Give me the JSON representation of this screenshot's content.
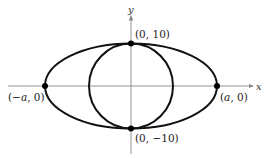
{
  "figure": {
    "axes": {
      "x_label": "x",
      "y_label": "y"
    },
    "points": [
      {
        "label": "(0, 10)"
      },
      {
        "label": "(0, −10)"
      },
      {
        "label_prefix": "(−",
        "label_var": "a",
        "label_suffix": ", 0)"
      },
      {
        "label_prefix": "(",
        "label_var": "a",
        "label_suffix": ", 0)"
      }
    ],
    "curves": [
      "ellipse",
      "circle"
    ],
    "colors": {
      "curve": "#111111",
      "axis": "#888888",
      "point": "#000000"
    }
  }
}
